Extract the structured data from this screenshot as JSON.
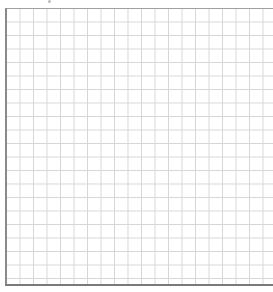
{
  "page": {
    "type": "graph-paper",
    "grid": {
      "columns": 20,
      "rows": 20,
      "line_color": "#d6d6d6",
      "border_color": "#8a8a8a"
    }
  }
}
